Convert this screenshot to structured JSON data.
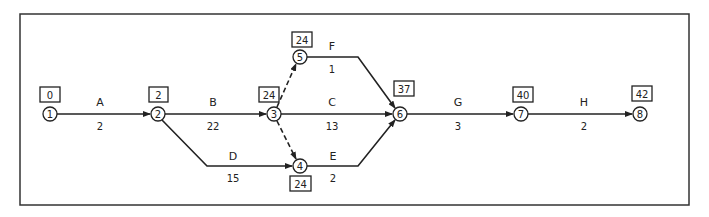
{
  "diagram": {
    "type": "activity-on-arrow network (CPM)",
    "nodes": [
      {
        "id": "1",
        "label": "1",
        "early_time": "0"
      },
      {
        "id": "2",
        "label": "2",
        "early_time": "2"
      },
      {
        "id": "3",
        "label": "3",
        "early_time": "24"
      },
      {
        "id": "4",
        "label": "4",
        "early_time": "24"
      },
      {
        "id": "5",
        "label": "5",
        "early_time": "24"
      },
      {
        "id": "6",
        "label": "6",
        "early_time": "37"
      },
      {
        "id": "7",
        "label": "7",
        "early_time": "40"
      },
      {
        "id": "8",
        "label": "8",
        "early_time": "42"
      }
    ],
    "activities": [
      {
        "name": "A",
        "from": "1",
        "to": "2",
        "duration": "2"
      },
      {
        "name": "B",
        "from": "2",
        "to": "3",
        "duration": "22"
      },
      {
        "name": "D",
        "from": "2",
        "to": "4",
        "duration": "15"
      },
      {
        "name": "C",
        "from": "3",
        "to": "6",
        "duration": "13"
      },
      {
        "name": "F",
        "from": "5",
        "to": "6",
        "duration": "1"
      },
      {
        "name": "E",
        "from": "4",
        "to": "6",
        "duration": "2"
      },
      {
        "name": "G",
        "from": "6",
        "to": "7",
        "duration": "3"
      },
      {
        "name": "H",
        "from": "7",
        "to": "8",
        "duration": "2"
      }
    ],
    "dummies": [
      {
        "from": "3",
        "to": "5"
      },
      {
        "from": "3",
        "to": "4"
      }
    ]
  }
}
